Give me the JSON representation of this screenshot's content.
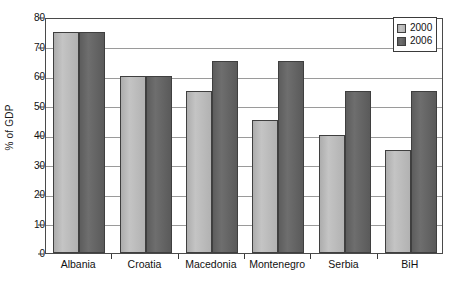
{
  "chart_data": {
    "type": "bar",
    "title": "",
    "subtitle": "",
    "xlabel": "",
    "ylabel": "% of GDP",
    "ylim": [
      0,
      80
    ],
    "yticks": [
      0,
      10,
      20,
      30,
      40,
      50,
      60,
      70,
      80
    ],
    "ytick_labels": [
      "0",
      "10",
      "20",
      "30",
      "40",
      "50",
      "60",
      "70",
      "80"
    ],
    "grid": true,
    "legend_position": "top-right",
    "categories": [
      "Albania",
      "Croatia",
      "Macedonia",
      "Montenegro",
      "Serbia",
      "BiH"
    ],
    "series": [
      {
        "name": "2000",
        "color": "#b8b8b8",
        "values": [
          75,
          60,
          55,
          45,
          40,
          35
        ]
      },
      {
        "name": "2006",
        "color": "#616161",
        "values": [
          75,
          60,
          65,
          65,
          55,
          55
        ]
      }
    ]
  },
  "legend": {
    "entries": [
      {
        "label": "2000"
      },
      {
        "label": "2006"
      }
    ]
  },
  "colors": {
    "series_2000": "#b8b8b8",
    "series_2006": "#616161",
    "axis": "#4a4a4a",
    "gridline": "#9a9a9a",
    "text": "#111111",
    "background": "#ffffff"
  }
}
